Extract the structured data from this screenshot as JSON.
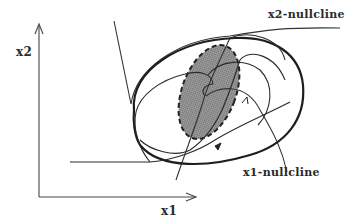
{
  "diagram": {
    "type": "phase-plane",
    "axes": {
      "x_label": "x1",
      "y_label": "x2"
    },
    "labels": {
      "x2_nullcline": "x2-nullcline",
      "x1_nullcline": "x1-nullcline"
    },
    "elements": [
      {
        "name": "limit-cycle",
        "style": "bold solid closed curve"
      },
      {
        "name": "unstable-region",
        "style": "dashed ellipse, grey shaded"
      },
      {
        "name": "x1-nullcline",
        "style": "thin curve"
      },
      {
        "name": "x2-nullcline",
        "style": "thin curve"
      },
      {
        "name": "trajectories",
        "style": "thin curves with direction arrows"
      }
    ],
    "colors": {
      "stroke": "#222222",
      "shade": "#8a8a8a",
      "background": "#ffffff"
    }
  }
}
